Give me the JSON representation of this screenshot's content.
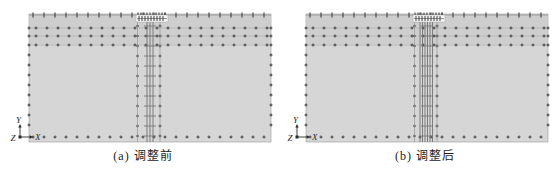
{
  "figure": {
    "type": "fem-mesh-comparison",
    "panels": [
      {
        "id": "a",
        "caption": "(a) 调整前",
        "axis_labels": {
          "vertical": "Y",
          "horizontal": "X",
          "depth": "Z"
        },
        "pile_core_offsets": [
          118,
          121,
          124
        ]
      },
      {
        "id": "b",
        "caption": "(b) 调整后",
        "axis_labels": {
          "vertical": "Y",
          "horizontal": "X",
          "depth": "Z"
        },
        "pile_core_offsets": [
          114,
          116.5,
          119,
          121.5,
          124,
          126.5
        ]
      }
    ],
    "colors": {
      "background": "#ffffff",
      "soil": "#d6d6d6",
      "soil_top_strip": "#cecece",
      "mesh_line": "#b3b3b3",
      "edge_line": "#9a9a9a",
      "pile_line": "#6e6e6e",
      "marker": "#3d3d3d",
      "cap_fill": "#f5f5f5",
      "cap_hatch": "#2f2f2f",
      "caption_text": "#1b1b1b",
      "axis_text": "#2a2a2a"
    },
    "mesh_spec": {
      "block": {
        "w": 242,
        "h": 128
      },
      "panel_origins": [
        {
          "x": 29,
          "y": 14
        },
        {
          "x": 306,
          "y": 14
        }
      ],
      "horizontal_rows": [
        14,
        22,
        31
      ],
      "top_marker_step": 11,
      "row_marker_step": 11,
      "edge_marker_ys": [
        14,
        22,
        31,
        41,
        51,
        61,
        71,
        81,
        91,
        101,
        111
      ],
      "bottom_row_y": 123,
      "pile": {
        "flanks": [
          108.5,
          131
        ],
        "tick_y0": 12,
        "tick_y1": 122,
        "tick_step": 10,
        "tick_x0": 115,
        "tick_x1": 127
      },
      "cap": {
        "x": 107,
        "y": 1,
        "w": 32,
        "h": 7
      },
      "axis_origin_offset": {
        "x": -9,
        "y": 123
      }
    }
  }
}
